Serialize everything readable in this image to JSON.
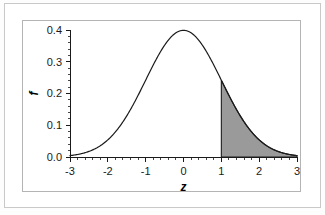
{
  "chart_data": {
    "type": "area",
    "title": "",
    "subtitle": "",
    "xlabel": "z",
    "ylabel": "f",
    "xlim": [
      -3,
      3
    ],
    "ylim": [
      0.0,
      0.4
    ],
    "grid": false,
    "legend": "none",
    "x_ticks": [
      "-3",
      "-2",
      "-1",
      "0",
      "1",
      "2",
      "3"
    ],
    "x_tick_values": [
      -3,
      -2,
      -1,
      0,
      1,
      2,
      3
    ],
    "x_minor_tick_step": 0.2,
    "y_ticks": [
      "0.0",
      "0.1",
      "0.2",
      "0.3",
      "0.4"
    ],
    "y_tick_values": [
      0.0,
      0.1,
      0.2,
      0.3,
      0.4
    ],
    "y_minor_tick_step": 0.02,
    "series": [
      {
        "name": "standard normal density",
        "function": "standard_normal_pdf",
        "mean": 0,
        "sd": 1,
        "x": [
          -3.0,
          -2.8,
          -2.6,
          -2.4,
          -2.2,
          -2.0,
          -1.8,
          -1.6,
          -1.4,
          -1.2,
          -1.0,
          -0.8,
          -0.6,
          -0.4,
          -0.2,
          0.0,
          0.2,
          0.4,
          0.6,
          0.8,
          1.0,
          1.2,
          1.4,
          1.6,
          1.8,
          2.0,
          2.2,
          2.4,
          2.6,
          2.8,
          3.0
        ],
        "values": [
          0.0044,
          0.0079,
          0.0136,
          0.0224,
          0.0355,
          0.054,
          0.079,
          0.1109,
          0.1497,
          0.1942,
          0.242,
          0.2897,
          0.3332,
          0.3683,
          0.391,
          0.3989,
          0.391,
          0.3683,
          0.3332,
          0.2897,
          0.242,
          0.1942,
          0.1497,
          0.1109,
          0.079,
          0.054,
          0.0355,
          0.0224,
          0.0136,
          0.0079,
          0.0044
        ],
        "line_color": "#1a1a1a",
        "line_width": 1.2
      }
    ],
    "shaded_region": {
      "label": "right tail area",
      "from": 1.0,
      "to": 3.0,
      "fill_color": "#9a9a9a",
      "edge_color": "#1a1a1a",
      "height_at_from": 0.242
    },
    "peak": {
      "x": 0,
      "y": 0.3989
    },
    "axis_color": "#1a1a1a",
    "frame_color": "#b4b4b4",
    "background_color": "#ffffff"
  }
}
